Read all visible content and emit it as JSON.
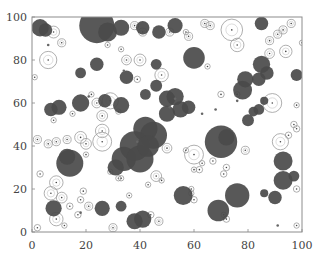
{
  "chart_data": {
    "type": "scatter",
    "title": "",
    "xlabel": "",
    "ylabel": "",
    "xlim": [
      0,
      100
    ],
    "ylim": [
      0,
      100
    ],
    "grid": false,
    "legend": null,
    "x_ticks": [
      "0",
      "20",
      "40",
      "60",
      "80",
      "100"
    ],
    "y_ticks": [
      "0",
      "20",
      "40",
      "60",
      "80",
      "100"
    ],
    "colors": {
      "filled": "#4a4a4a",
      "outline": "#9a9a9a",
      "frame": "#8c8c8c",
      "center_dot": "#444444"
    },
    "filled_circles": [
      {
        "x": 3,
        "y": 95,
        "r": 3.2
      },
      {
        "x": 5,
        "y": 94,
        "r": 2.5
      },
      {
        "x": 24,
        "y": 96,
        "r": 6.5
      },
      {
        "x": 28,
        "y": 93,
        "r": 3.5
      },
      {
        "x": 33,
        "y": 95,
        "r": 3
      },
      {
        "x": 41,
        "y": 95,
        "r": 2.5
      },
      {
        "x": 47,
        "y": 93,
        "r": 2.5
      },
      {
        "x": 53,
        "y": 96,
        "r": 2.8
      },
      {
        "x": 85,
        "y": 97,
        "r": 2.5
      },
      {
        "x": 24,
        "y": 78,
        "r": 2.5
      },
      {
        "x": 18,
        "y": 74,
        "r": 2
      },
      {
        "x": 35,
        "y": 72,
        "r": 2.5
      },
      {
        "x": 46,
        "y": 78,
        "r": 2
      },
      {
        "x": 60,
        "y": 81,
        "r": 4
      },
      {
        "x": 85,
        "y": 78,
        "r": 3.2
      },
      {
        "x": 87,
        "y": 74,
        "r": 2.5
      },
      {
        "x": 84,
        "y": 71,
        "r": 2.5
      },
      {
        "x": 98,
        "y": 73,
        "r": 2.2
      },
      {
        "x": 7,
        "y": 57,
        "r": 2.5
      },
      {
        "x": 10,
        "y": 58,
        "r": 2.8
      },
      {
        "x": 18,
        "y": 60,
        "r": 3.2
      },
      {
        "x": 33,
        "y": 59,
        "r": 3
      },
      {
        "x": 27,
        "y": 61,
        "r": 2.5
      },
      {
        "x": 42,
        "y": 64,
        "r": 2
      },
      {
        "x": 46,
        "y": 68,
        "r": 2.2
      },
      {
        "x": 50,
        "y": 62,
        "r": 3
      },
      {
        "x": 53,
        "y": 63,
        "r": 3.2
      },
      {
        "x": 55,
        "y": 57,
        "r": 3
      },
      {
        "x": 50,
        "y": 55,
        "r": 3
      },
      {
        "x": 58,
        "y": 58,
        "r": 2.5
      },
      {
        "x": 78,
        "y": 66,
        "r": 3.5
      },
      {
        "x": 79,
        "y": 71,
        "r": 3
      },
      {
        "x": 86,
        "y": 61,
        "r": 1.5
      },
      {
        "x": 84,
        "y": 57,
        "r": 2
      },
      {
        "x": 80,
        "y": 52,
        "r": 2.2
      },
      {
        "x": 82,
        "y": 56,
        "r": 1.8
      },
      {
        "x": 42,
        "y": 48,
        "r": 4.5
      },
      {
        "x": 45,
        "y": 45,
        "r": 5
      },
      {
        "x": 38,
        "y": 40,
        "r": 5.5
      },
      {
        "x": 34,
        "y": 34,
        "r": 4.5
      },
      {
        "x": 40,
        "y": 34,
        "r": 5
      },
      {
        "x": 43,
        "y": 40,
        "r": 4
      },
      {
        "x": 70,
        "y": 42,
        "r": 6
      },
      {
        "x": 72,
        "y": 44,
        "r": 3
      },
      {
        "x": 14,
        "y": 32,
        "r": 5
      },
      {
        "x": 13,
        "y": 35,
        "r": 3
      },
      {
        "x": 93,
        "y": 33,
        "r": 3.5
      },
      {
        "x": 31,
        "y": 30,
        "r": 3
      },
      {
        "x": 93,
        "y": 24,
        "r": 3.5
      },
      {
        "x": 97,
        "y": 26,
        "r": 2
      },
      {
        "x": 76,
        "y": 17,
        "r": 4.5
      },
      {
        "x": 56,
        "y": 17,
        "r": 3.5
      },
      {
        "x": 69,
        "y": 10,
        "r": 4
      },
      {
        "x": 90,
        "y": 16,
        "r": 2.5
      },
      {
        "x": 8,
        "y": 11,
        "r": 3
      },
      {
        "x": 26,
        "y": 11,
        "r": 2.8
      },
      {
        "x": 33,
        "y": 12,
        "r": 2
      },
      {
        "x": 38,
        "y": 5,
        "r": 3
      },
      {
        "x": 41,
        "y": 6,
        "r": 3.2
      },
      {
        "x": 86,
        "y": 18,
        "r": 1.5
      }
    ],
    "outline_circles": [
      {
        "x": 8,
        "y": 93,
        "r": 2.2
      },
      {
        "x": 11,
        "y": 88,
        "r": 1.5
      },
      {
        "x": 6,
        "y": 80,
        "r": 3.2
      },
      {
        "x": 1,
        "y": 72,
        "r": 1
      },
      {
        "x": 28,
        "y": 87,
        "r": 1
      },
      {
        "x": 35,
        "y": 80,
        "r": 1.8
      },
      {
        "x": 40,
        "y": 80,
        "r": 2.2
      },
      {
        "x": 33,
        "y": 85,
        "r": 1
      },
      {
        "x": 38,
        "y": 96,
        "r": 1.5
      },
      {
        "x": 41,
        "y": 93,
        "r": 1.5
      },
      {
        "x": 58,
        "y": 91,
        "r": 1.5
      },
      {
        "x": 51,
        "y": 93,
        "r": 1.5
      },
      {
        "x": 64,
        "y": 97,
        "r": 1.5
      },
      {
        "x": 66,
        "y": 96,
        "r": 1.5
      },
      {
        "x": 96,
        "y": 97,
        "r": 1.5
      },
      {
        "x": 91,
        "y": 92,
        "r": 1.5
      },
      {
        "x": 93,
        "y": 94,
        "r": 1.5
      },
      {
        "x": 88,
        "y": 89,
        "r": 1.5
      },
      {
        "x": 57,
        "y": 93,
        "r": 1
      },
      {
        "x": 74,
        "y": 94,
        "r": 4
      },
      {
        "x": 76,
        "y": 87,
        "r": 2.5
      },
      {
        "x": 88,
        "y": 83,
        "r": 1.8
      },
      {
        "x": 94,
        "y": 84,
        "r": 2.3
      },
      {
        "x": 100,
        "y": 88,
        "r": 1
      },
      {
        "x": 65,
        "y": 77,
        "r": 1
      },
      {
        "x": 76,
        "y": 64,
        "r": 1
      },
      {
        "x": 76,
        "y": 64,
        "r": 1
      },
      {
        "x": 70,
        "y": 64,
        "r": 1.2
      },
      {
        "x": 89,
        "y": 60,
        "r": 3.5
      },
      {
        "x": 98,
        "y": 59,
        "r": 1
      },
      {
        "x": 39,
        "y": 71,
        "r": 1.2
      },
      {
        "x": 48,
        "y": 73,
        "r": 2.5
      },
      {
        "x": 22,
        "y": 64,
        "r": 1
      },
      {
        "x": 24,
        "y": 60,
        "r": 1.8
      },
      {
        "x": 29,
        "y": 61,
        "r": 3
      },
      {
        "x": 32,
        "y": 56,
        "r": 1
      },
      {
        "x": 26,
        "y": 54,
        "r": 2
      },
      {
        "x": 15,
        "y": 55,
        "r": 1
      },
      {
        "x": 8,
        "y": 52,
        "r": 1
      },
      {
        "x": 18,
        "y": 44,
        "r": 2.2
      },
      {
        "x": 26,
        "y": 47,
        "r": 2.5
      },
      {
        "x": 2,
        "y": 43,
        "r": 1.5
      },
      {
        "x": 6,
        "y": 41,
        "r": 1.5
      },
      {
        "x": 9,
        "y": 42,
        "r": 1.5
      },
      {
        "x": 13,
        "y": 43,
        "r": 1.5
      },
      {
        "x": 20,
        "y": 41,
        "r": 2
      },
      {
        "x": 26,
        "y": 42,
        "r": 3.5
      },
      {
        "x": 20,
        "y": 36,
        "r": 1
      },
      {
        "x": 3,
        "y": 27,
        "r": 1.2
      },
      {
        "x": 9,
        "y": 23,
        "r": 2.5
      },
      {
        "x": 7,
        "y": 18,
        "r": 2.5
      },
      {
        "x": 11,
        "y": 16,
        "r": 2
      },
      {
        "x": 14,
        "y": 12,
        "r": 1.2
      },
      {
        "x": 19,
        "y": 19,
        "r": 1.2
      },
      {
        "x": 18,
        "y": 15,
        "r": 1.2
      },
      {
        "x": 21,
        "y": 12,
        "r": 1.5
      },
      {
        "x": 17,
        "y": 8,
        "r": 1.2
      },
      {
        "x": 9,
        "y": 6,
        "r": 2.5
      },
      {
        "x": 12,
        "y": 3,
        "r": 1
      },
      {
        "x": 2,
        "y": 2,
        "r": 1.2
      },
      {
        "x": 30,
        "y": 2,
        "r": 1.5
      },
      {
        "x": 36,
        "y": 17,
        "r": 1
      },
      {
        "x": 44,
        "y": 8,
        "r": 1.2
      },
      {
        "x": 47,
        "y": 5,
        "r": 1.5
      },
      {
        "x": 29,
        "y": 28,
        "r": 1
      },
      {
        "x": 32,
        "y": 25,
        "r": 1
      },
      {
        "x": 33,
        "y": 25,
        "r": 1
      },
      {
        "x": 43,
        "y": 22,
        "r": 1
      },
      {
        "x": 46,
        "y": 26,
        "r": 2
      },
      {
        "x": 48,
        "y": 24,
        "r": 1
      },
      {
        "x": 50,
        "y": 39,
        "r": 1.8
      },
      {
        "x": 60,
        "y": 36,
        "r": 3.5
      },
      {
        "x": 57,
        "y": 38,
        "r": 1
      },
      {
        "x": 60,
        "y": 29,
        "r": 1
      },
      {
        "x": 62,
        "y": 29,
        "r": 1.2
      },
      {
        "x": 63,
        "y": 32,
        "r": 1
      },
      {
        "x": 67,
        "y": 33,
        "r": 1.2
      },
      {
        "x": 72,
        "y": 30,
        "r": 1.2
      },
      {
        "x": 71,
        "y": 27,
        "r": 1.2
      },
      {
        "x": 79,
        "y": 38,
        "r": 1.5
      },
      {
        "x": 92,
        "y": 42,
        "r": 3
      },
      {
        "x": 95,
        "y": 45,
        "r": 1.2
      },
      {
        "x": 97,
        "y": 50,
        "r": 1.2
      },
      {
        "x": 98,
        "y": 48,
        "r": 1.2
      },
      {
        "x": 98,
        "y": 20,
        "r": 1.2
      },
      {
        "x": 59,
        "y": 20,
        "r": 1
      },
      {
        "x": 59,
        "y": 18,
        "r": 1
      },
      {
        "x": 60,
        "y": 15,
        "r": 1.2
      },
      {
        "x": 72,
        "y": 6,
        "r": 1.2
      },
      {
        "x": 71,
        "y": 8,
        "r": 1
      },
      {
        "x": 98,
        "y": 3,
        "r": 1
      }
    ],
    "small_points": [
      {
        "x": 6,
        "y": 87
      },
      {
        "x": 34,
        "y": 75
      },
      {
        "x": 21,
        "y": 63
      },
      {
        "x": 53,
        "y": 62
      },
      {
        "x": 76,
        "y": 61
      },
      {
        "x": 39,
        "y": 42
      },
      {
        "x": 18,
        "y": 9
      },
      {
        "x": 68,
        "y": 57
      },
      {
        "x": 91,
        "y": 3
      },
      {
        "x": 51,
        "y": 58
      },
      {
        "x": 63,
        "y": 55
      }
    ]
  }
}
